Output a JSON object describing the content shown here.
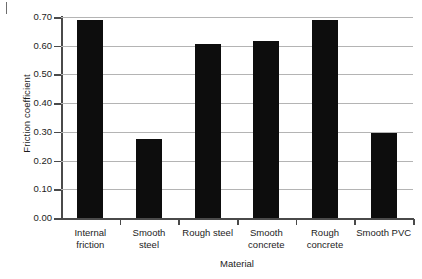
{
  "chart_data": {
    "type": "bar",
    "title": "",
    "xlabel": "Material",
    "ylabel": "Friction coefficient",
    "categories": [
      "Internal friction",
      "Smooth steel",
      "Rough steel",
      "Smooth concrete",
      "Rough concrete",
      "Smooth PVC"
    ],
    "category_lines": [
      [
        "Internal",
        "friction"
      ],
      [
        "Smooth",
        "steel"
      ],
      [
        "Rough steel",
        ""
      ],
      [
        "Smooth",
        "concrete"
      ],
      [
        "Rough",
        "concrete"
      ],
      [
        "Smooth PVC",
        ""
      ]
    ],
    "values": [
      0.69,
      0.275,
      0.605,
      0.615,
      0.69,
      0.295
    ],
    "ylim": [
      0.0,
      0.7
    ],
    "ytick_values": [
      0.0,
      0.1,
      0.2,
      0.3,
      0.4,
      0.5,
      0.6,
      0.7
    ],
    "ytick_labels": [
      "0.00",
      "0.10",
      "0.20",
      "0.30",
      "0.40",
      "0.50",
      "0.60",
      "0.70"
    ],
    "grid": "horizontal",
    "legend": "none",
    "bar_color": "#0d0d0d",
    "grid_color": "#b4b4b4",
    "axis_color": "#4a4a4a",
    "background_color": "#ffffff"
  }
}
